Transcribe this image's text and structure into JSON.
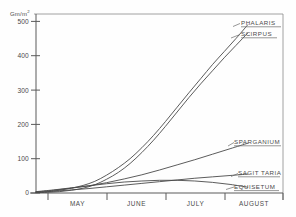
{
  "chart_data": {
    "type": "line",
    "title": "",
    "subtitle": "",
    "xlabel": "",
    "ylabel": "Gm/m",
    "ylabel_superscript": "2",
    "ylim": [
      0,
      520
    ],
    "yticks": [
      0,
      100,
      200,
      300,
      400,
      500
    ],
    "ytick_labels": [
      "0",
      "100",
      "200",
      "300",
      "400",
      "500"
    ],
    "x": [
      "May",
      "June",
      "July",
      "August"
    ],
    "xtick_labels": [
      "MAY",
      "JUNE",
      "JULY",
      "AUGUST"
    ],
    "grid": false,
    "legend_position": "right-inline-labels",
    "annotations": [
      "PHALARIS",
      "SCIRPUS",
      "SPARGANIUM",
      "SAGITTARIA",
      "EQUISETUM"
    ],
    "series": [
      {
        "name": "PHALARIS",
        "label": "PHALARIS",
        "x": [
          0.0,
          0.2,
          0.4,
          0.6,
          0.8,
          1.0,
          1.2,
          1.4,
          1.6,
          1.8,
          2.0,
          2.2,
          2.4,
          2.6,
          2.8,
          3.0,
          3.2,
          3.4,
          3.6
        ],
        "values": [
          2,
          4,
          8,
          14,
          22,
          34,
          52,
          74,
          100,
          132,
          168,
          208,
          250,
          292,
          333,
          374,
          412,
          450,
          490
        ]
      },
      {
        "name": "SCIRPUS",
        "label": "SCIRPUS",
        "x": [
          0.0,
          0.2,
          0.4,
          0.6,
          0.8,
          1.0,
          1.2,
          1.4,
          1.6,
          1.8,
          2.0,
          2.2,
          2.4,
          2.6,
          2.8,
          3.0,
          3.2,
          3.4,
          3.6
        ],
        "values": [
          1,
          2,
          4,
          8,
          14,
          24,
          40,
          60,
          86,
          118,
          154,
          194,
          236,
          278,
          318,
          356,
          394,
          430,
          466
        ]
      },
      {
        "name": "SPARGANIUM",
        "label": "SPARGANIUM",
        "x": [
          0.0,
          0.3,
          0.6,
          0.9,
          1.2,
          1.5,
          1.8,
          2.1,
          2.4,
          2.7,
          3.0,
          3.3,
          3.6
        ],
        "values": [
          3,
          8,
          14,
          21,
          30,
          41,
          53,
          67,
          82,
          97,
          113,
          129,
          145
        ]
      },
      {
        "name": "SAGITTARIA",
        "label": "SAGITTARIA",
        "x": [
          0.0,
          0.3,
          0.6,
          0.9,
          1.2,
          1.5,
          1.8,
          2.1,
          2.4,
          2.7,
          3.0,
          3.3,
          3.6
        ],
        "values": [
          2,
          5,
          9,
          13,
          18,
          23,
          28,
          33,
          38,
          43,
          47,
          51,
          55
        ]
      },
      {
        "name": "EQUISETUM",
        "label": "EQUISETUM",
        "x": [
          0.0,
          0.3,
          0.6,
          0.9,
          1.2,
          1.5,
          1.8,
          2.1,
          2.4,
          2.7,
          3.0,
          3.3,
          3.6
        ],
        "values": [
          4,
          9,
          15,
          21,
          27,
          32,
          35,
          37,
          37,
          35,
          31,
          25,
          17
        ]
      }
    ]
  },
  "axis": {
    "y_title": "Gm/m",
    "y_title_sup": "2",
    "y_labels": [
      "500",
      "400",
      "300",
      "200",
      "100",
      "0"
    ],
    "x_labels": [
      "MAY",
      "JUNE",
      "JULY",
      "AUGUST"
    ]
  },
  "labels": {
    "phalaris": "PHALARIS",
    "scirpus": "SCIRPUS",
    "sparganium": "SPARGANIUM",
    "sagittaria": "SAGIT TARIA",
    "equisetum": "EQUISETUM"
  },
  "colors": {
    "background": "#fefefe",
    "ink": "#4a4a4a",
    "axis": "#5a5a5a",
    "frame": "#8a8a8a"
  }
}
